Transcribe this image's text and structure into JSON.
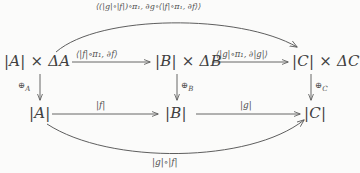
{
  "diagram": {
    "type": "commutative-diagram",
    "nodes": {
      "top_left": "|A| × ΔA",
      "top_mid": "|B| × ΔB",
      "top_right": "|C| × ΔC",
      "bottom_left": "|A|",
      "bottom_mid": "|B|",
      "bottom_right": "|C|"
    },
    "edges": {
      "top_left_to_mid": "⟨|f|∘π₁, ∂f⟩",
      "top_mid_to_right": "⟨|g|∘π₁, ∂|g|⟩",
      "vertical_left": "⊕",
      "vertical_left_sub": "A",
      "vertical_mid": "⊕",
      "vertical_mid_sub": "B",
      "vertical_right": "⊕",
      "vertical_right_sub": "C",
      "bottom_left_to_mid": "|f|",
      "bottom_mid_to_right": "|g|",
      "top_curve": "⟨(|g|∘|f|)∘π₁, ∂g∘⟨|f|∘π₁, ∂f⟩⟩",
      "bottom_curve": "|g|∘|f|"
    },
    "colors": {
      "background": "#fbfbfa",
      "ink": "#4a4a4a",
      "stroke": "#555555"
    }
  }
}
